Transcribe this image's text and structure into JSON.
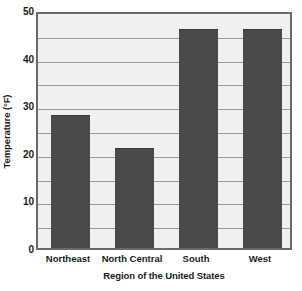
{
  "chart_data": {
    "type": "bar",
    "title": "",
    "categories": [
      "Northeast",
      "North Central",
      "South",
      "West"
    ],
    "values": [
      28,
      21,
      46,
      46
    ],
    "series": [
      {
        "name": "Temperature",
        "values": [
          28,
          21,
          46,
          46
        ]
      }
    ],
    "xlabel": "Region of the United States",
    "ylabel": "Temperature (°F)",
    "ylim": [
      0,
      50
    ],
    "ytick_labels": [
      "0",
      "10",
      "20",
      "30",
      "40",
      "50"
    ],
    "ytick_values": [
      0,
      10,
      20,
      30,
      40,
      50
    ],
    "gridline_values": [
      5,
      10,
      15,
      20,
      25,
      30,
      35,
      40,
      45,
      50
    ],
    "grid": true,
    "grid_axis": "y",
    "grid_interval": 5,
    "legend": false,
    "legend_position": "none",
    "colors": {
      "bar_fill": "#4a4a4a",
      "plot_background": "#f0f0f0",
      "plot_border": "#6b6b6b",
      "gridline": "#9a9a9a",
      "text": "#1b1b1b",
      "page_background": "#ffffff"
    }
  }
}
